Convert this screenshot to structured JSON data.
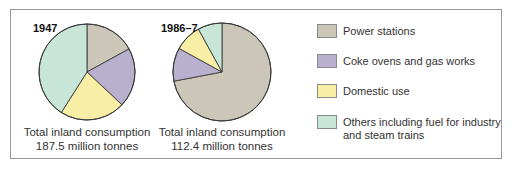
{
  "chart_data": [
    {
      "type": "pie",
      "title": "1947",
      "categories": [
        "Power stations",
        "Coke ovens and gas works",
        "Domestic use",
        "Others including fuel for industry and steam trains"
      ],
      "values": [
        17,
        20,
        22,
        41
      ],
      "unit": "% (estimated)",
      "caption": [
        "Total inland consumption",
        "187.5 million tonnes"
      ],
      "start_angle": "12 o'clock, clockwise"
    },
    {
      "type": "pie",
      "title": "1986–7",
      "categories": [
        "Power stations",
        "Coke ovens and gas works",
        "Domestic use",
        "Others including fuel for industry and steam trains"
      ],
      "values": [
        72,
        11,
        9,
        8
      ],
      "unit": "% (estimated)",
      "caption": [
        "Total inland consumption",
        "112.4 million tonnes"
      ],
      "start_angle": "12 o'clock, clockwise"
    }
  ],
  "pies": [
    {
      "year": "1947",
      "caption_line1": "Total inland consumption",
      "caption_line2": "187.5 million tonnes"
    },
    {
      "year": "1986–7",
      "caption_line1": "Total inland consumption",
      "caption_line2": "112.4 million tonnes"
    }
  ],
  "legend": {
    "items": [
      {
        "label": "Power stations",
        "color": "#cbc6b8"
      },
      {
        "label": "Coke ovens and gas works",
        "color": "#b8b0cc"
      },
      {
        "label": "Domestic use",
        "color": "#f8eea6"
      },
      {
        "label": "Others including fuel for industry and steam trains",
        "color": "#c8e6d8"
      }
    ]
  }
}
